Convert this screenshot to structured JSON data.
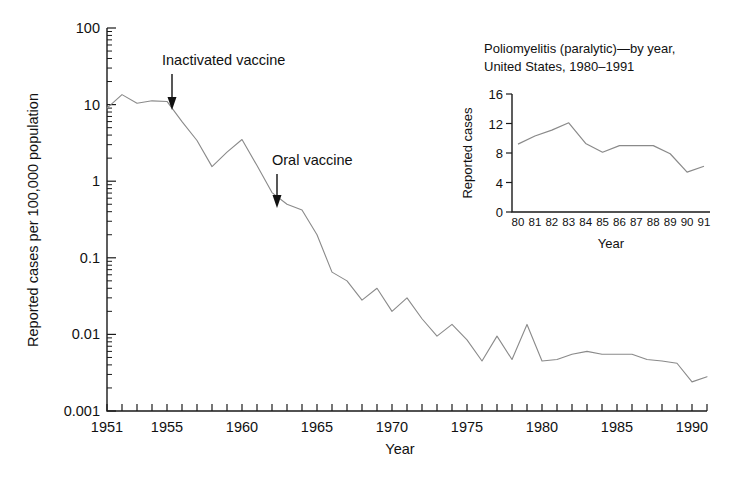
{
  "figure": {
    "background_color": "#ffffff",
    "line_color": "#8a8a8a",
    "axis_color": "#1a1a1a"
  },
  "main": {
    "ylabel": "Reported cases per 100,000 population",
    "xlabel": "Year",
    "ytick_labels": [
      "100",
      "10",
      "1",
      "0.1",
      "0.01",
      "0.001"
    ],
    "xtick_labels": [
      "1951",
      "1955",
      "1960",
      "1965",
      "1970",
      "1975",
      "1980",
      "1985",
      "1990"
    ],
    "annotations": [
      {
        "text": "Inactivated vaccine",
        "year": 1955
      },
      {
        "text": "Oral vaccine",
        "year": 1962
      }
    ]
  },
  "inset": {
    "title_line1": "Poliomyelitis (paralytic)—by year,",
    "title_line2": "United States, 1980–1991",
    "ylabel": "Reported cases",
    "xlabel": "Year",
    "ytick_labels": [
      "16",
      "12",
      "8",
      "4",
      "0"
    ],
    "xtick_labels": [
      "80",
      "81",
      "82",
      "83",
      "84",
      "85",
      "86",
      "87",
      "88",
      "89",
      "90",
      "91"
    ]
  },
  "chart_data": [
    {
      "id": "main",
      "type": "line",
      "title": "",
      "xlabel": "Year",
      "ylabel": "Reported cases per 100,000 population",
      "yscale": "log",
      "ylim": [
        0.001,
        100
      ],
      "xlim": [
        1951,
        1991
      ],
      "grid": false,
      "legend": "none",
      "ytick_values": [
        100,
        10,
        1,
        0.1,
        0.01,
        0.001
      ],
      "xtick_values": [
        1951,
        1955,
        1960,
        1965,
        1970,
        1975,
        1980,
        1985,
        1990
      ],
      "x": [
        1951,
        1952,
        1953,
        1954,
        1955,
        1956,
        1957,
        1958,
        1959,
        1960,
        1961,
        1962,
        1963,
        1964,
        1965,
        1966,
        1967,
        1968,
        1969,
        1970,
        1971,
        1972,
        1973,
        1974,
        1975,
        1976,
        1977,
        1978,
        1979,
        1980,
        1981,
        1982,
        1983,
        1984,
        1985,
        1986,
        1987,
        1988,
        1989,
        1990,
        1991
      ],
      "y": [
        9.0,
        13.5,
        10.4,
        11.2,
        11.0,
        6.0,
        3.4,
        1.55,
        2.4,
        3.5,
        1.6,
        0.71,
        0.5,
        0.42,
        0.2,
        0.065,
        0.05,
        0.028,
        0.04,
        0.02,
        0.03,
        0.016,
        0.0095,
        0.0135,
        0.0085,
        0.0045,
        0.0095,
        0.0047,
        0.0135,
        0.0045,
        0.0047,
        0.0055,
        0.006,
        0.0055,
        0.0055,
        0.0055,
        0.0047,
        0.0045,
        0.0042,
        0.0024,
        0.0028
      ],
      "annotations": [
        {
          "text": "Inactivated vaccine",
          "x": 1955,
          "y": 11.0
        },
        {
          "text": "Oral vaccine",
          "x": 1962,
          "y": 0.71
        }
      ]
    },
    {
      "id": "inset",
      "type": "line",
      "title": "Poliomyelitis (paralytic)—by year, United States, 1980–1991",
      "xlabel": "Year",
      "ylabel": "Reported cases",
      "yscale": "linear",
      "ylim": [
        0,
        16
      ],
      "grid": false,
      "legend": "none",
      "ytick_values": [
        0,
        4,
        8,
        12,
        16
      ],
      "categories": [
        "80",
        "81",
        "82",
        "83",
        "84",
        "85",
        "86",
        "87",
        "88",
        "89",
        "90",
        "91"
      ],
      "values": [
        9.2,
        10.3,
        11.1,
        12.1,
        9.3,
        8.1,
        9.0,
        9.0,
        9.0,
        7.9,
        5.4,
        6.2
      ]
    }
  ]
}
